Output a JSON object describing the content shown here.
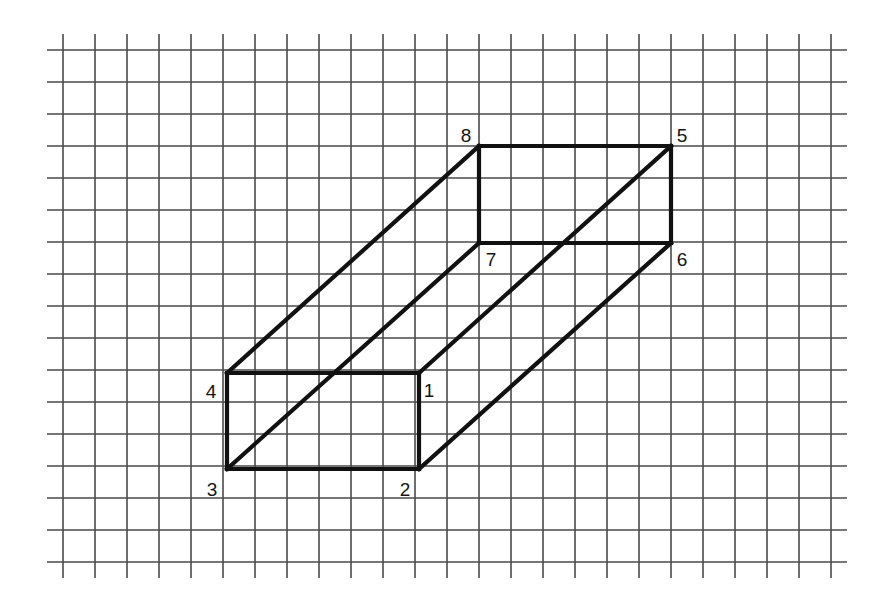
{
  "figure": {
    "canvas": {
      "width": 887,
      "height": 605,
      "background": "#ffffff"
    },
    "grid": {
      "line_color": "#4a4a4a",
      "line_width": 1.6,
      "cell_size": 32,
      "x_start": 63,
      "x_end": 831,
      "y_start": 50,
      "y_end": 562,
      "vertical_count": 25,
      "horizontal_count": 17,
      "overhang": 16
    },
    "solid": {
      "shape": "rectangular prism",
      "edge_color": "#111111",
      "edge_width": 4.2,
      "vertices": [
        {
          "id": "1",
          "x": 419,
          "y": 373,
          "label": "1",
          "label_x": 429,
          "label_y": 390
        },
        {
          "id": "2",
          "x": 419,
          "y": 469,
          "label": "2",
          "label_x": 405,
          "label_y": 489
        },
        {
          "id": "3",
          "x": 227,
          "y": 469,
          "label": "3",
          "label_x": 212,
          "label_y": 489
        },
        {
          "id": "4",
          "x": 227,
          "y": 373,
          "label": "4",
          "label_x": 211,
          "label_y": 391
        },
        {
          "id": "5",
          "x": 671,
          "y": 146,
          "label": "5",
          "label_x": 682,
          "label_y": 135
        },
        {
          "id": "6",
          "x": 671,
          "y": 243,
          "label": "6",
          "label_x": 682,
          "label_y": 259
        },
        {
          "id": "7",
          "x": 479,
          "y": 243,
          "label": "7",
          "label_x": 491,
          "label_y": 259
        },
        {
          "id": "8",
          "x": 479,
          "y": 146,
          "label": "8",
          "label_x": 466,
          "label_y": 135
        }
      ],
      "edges": [
        {
          "name": "front-top",
          "from": "4",
          "to": "1"
        },
        {
          "name": "front-right",
          "from": "1",
          "to": "2"
        },
        {
          "name": "front-bottom",
          "from": "2",
          "to": "3"
        },
        {
          "name": "front-left",
          "from": "3",
          "to": "4"
        },
        {
          "name": "back-top",
          "from": "8",
          "to": "5"
        },
        {
          "name": "back-right",
          "from": "5",
          "to": "6"
        },
        {
          "name": "back-bottom",
          "from": "6",
          "to": "7"
        },
        {
          "name": "back-left",
          "from": "7",
          "to": "8"
        },
        {
          "name": "depth-4-8",
          "from": "4",
          "to": "8"
        },
        {
          "name": "depth-1-5",
          "from": "1",
          "to": "5"
        },
        {
          "name": "depth-2-6",
          "from": "2",
          "to": "6"
        },
        {
          "name": "depth-3-7",
          "from": "3",
          "to": "7"
        }
      ]
    }
  }
}
